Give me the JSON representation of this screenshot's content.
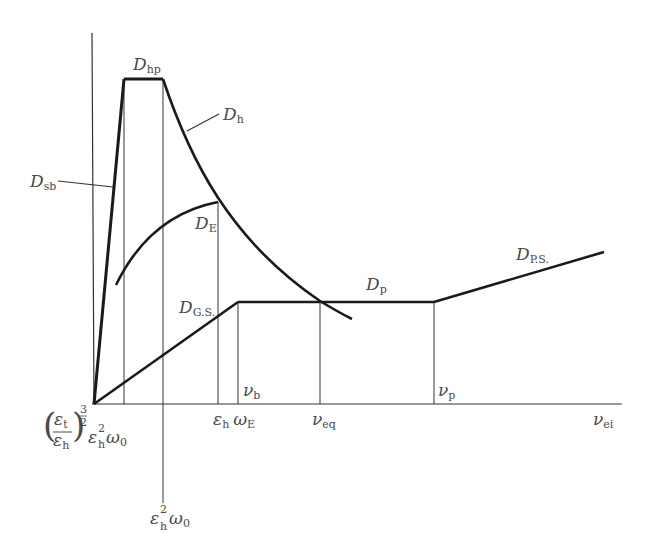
{
  "diagram": {
    "axes": {
      "x_label": {
        "main": "ν",
        "sub": "ei"
      },
      "y_label": ""
    },
    "curves": [
      {
        "id": "D_sb",
        "main": "D",
        "sub": "sb"
      },
      {
        "id": "D_hp",
        "main": "D",
        "sub": "hp"
      },
      {
        "id": "D_h",
        "main": "D",
        "sub": "h"
      },
      {
        "id": "D_E",
        "main": "D",
        "sub": "E"
      },
      {
        "id": "D_GS",
        "main": "D",
        "sub": "G.S."
      },
      {
        "id": "D_p",
        "main": "D",
        "sub": "p"
      },
      {
        "id": "D_PS",
        "main": "D",
        "sub": "P.S."
      }
    ],
    "x_markers": {
      "tick1": {
        "frac_num": "ε",
        "frac_num_sub": "t",
        "frac_den": "ε",
        "frac_den_sub": "h",
        "exp": "3",
        "exp_den": "2",
        "tail_main": "ε",
        "tail_sup": "2",
        "tail_sub": "h",
        "tail_omega": "ω",
        "tail_omega_sub": "0"
      },
      "tick2": {
        "main": "ε",
        "sup": "2",
        "sub": "h",
        "omega": "ω",
        "omega_sub": "0"
      },
      "tick3": {
        "main": "ε",
        "sub": "h",
        "omega": "ω",
        "omega_sub": "E"
      },
      "nu_b": {
        "main": "ν",
        "sub": "b"
      },
      "nu_eq": {
        "main": "ν",
        "sub": "eq"
      },
      "nu_p": {
        "main": "ν",
        "sub": "p"
      }
    }
  }
}
